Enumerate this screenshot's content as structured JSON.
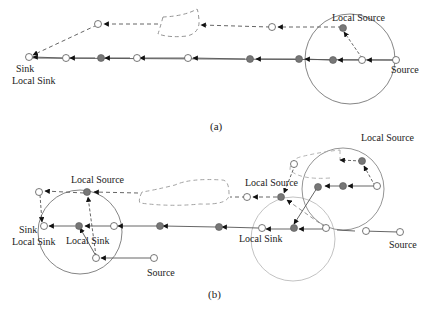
{
  "panel_a": {
    "caption": "(a)",
    "labels": {
      "sink": "Sink",
      "local_sink": "Local Sink",
      "local_source": "Local Source",
      "source": "Source"
    }
  },
  "panel_b": {
    "caption": "(b)",
    "labels": {
      "sink": "Sink",
      "local_sink_left": "Local Sink",
      "local_source_left": "Local Source",
      "local_sink_inner": "Local Sink",
      "source_left": "Source",
      "local_source_mid": "Local Source",
      "local_sink_mid": "Local Sink",
      "local_source_right": "Local Source",
      "source_right": "Source"
    }
  },
  "colors": {
    "line": "#444444",
    "dashed": "#666666",
    "filled_node": "#7a7a7a",
    "circle": "#888888",
    "faint_circle": "#bbbbbb"
  }
}
